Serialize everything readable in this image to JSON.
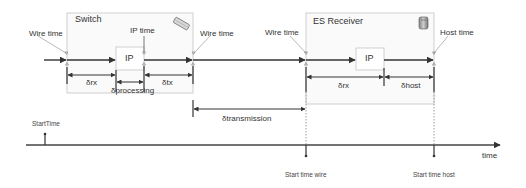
{
  "switch": {
    "title": "Switch",
    "icon": "network-switch-icon",
    "ip_label": "IP",
    "wire_time_in": "Wire time",
    "ip_time": "IP time",
    "wire_time_out": "Wire time",
    "delta_rx": "δrx",
    "delta_processing": "δprocessing",
    "delta_tx": "δtx"
  },
  "transmission": {
    "label": "δtransmission"
  },
  "receiver": {
    "title": "ES Receiver",
    "icon": "server-icon",
    "ip_label": "IP",
    "wire_time": "Wire time",
    "host_time": "Host time",
    "delta_rx": "δrx",
    "delta_host": "δhost"
  },
  "timeline": {
    "axis_label": "time",
    "start_time": "StartTime",
    "start_time_wire": "Start time wire",
    "start_time_host": "Start time host"
  },
  "colors": {
    "line": "#333333",
    "box_border": "#cccccc",
    "box_fill": "#fafafa",
    "dotted": "#888888"
  }
}
